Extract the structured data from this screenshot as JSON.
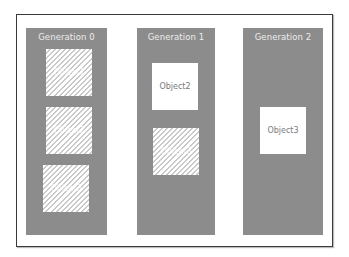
{
  "diagram": {
    "columns": [
      {
        "title": "Generation 0",
        "objects": [
          {
            "label": "Object1",
            "state": "collected"
          },
          {
            "label": "Object2",
            "state": "collected"
          },
          {
            "label": "Object3",
            "state": "collected"
          }
        ]
      },
      {
        "title": "Generation 1",
        "objects": [
          {
            "label": "Object2",
            "state": "live"
          },
          {
            "label": "Object3",
            "state": "collected"
          }
        ]
      },
      {
        "title": "Generation 2",
        "objects": [
          {
            "label": "Object3",
            "state": "live"
          }
        ]
      }
    ],
    "colors": {
      "column_fill": "#8c8c8c",
      "live_object": "#ffffff",
      "hatch": "#c9c9c9",
      "frame": "#3a3a3a"
    }
  }
}
